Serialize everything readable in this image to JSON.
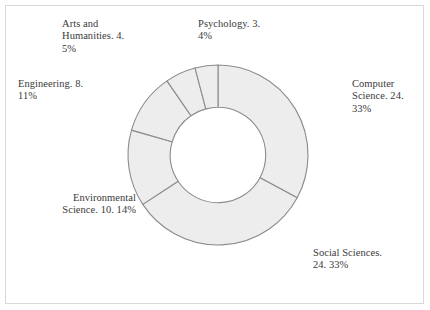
{
  "figure": {
    "background_color": "#ffffff",
    "border_color": "#d8d8d8",
    "slice_fill": "#ededed",
    "slice_stroke": "#8c8c8c",
    "label_color": "#3a3a3a"
  },
  "chart_data": {
    "type": "pie",
    "variant": "donut",
    "title": "",
    "subtitle": "",
    "xlabel": "",
    "ylabel": "",
    "legend_position": "none",
    "grid": false,
    "total": 73,
    "start_angle_deg": 0,
    "direction": "clockwise",
    "inner_radius_ratio": 0.53,
    "categories": [
      "Computer Science",
      "Social Sciences",
      "Environmental Science",
      "Engineering",
      "Arts and Humanities",
      "Psychology"
    ],
    "values": [
      24,
      24,
      10,
      8,
      4,
      3
    ],
    "percents": [
      33,
      33,
      14,
      11,
      5,
      4
    ],
    "slices": [
      {
        "name": "Computer Science",
        "value": 24,
        "percent": 33,
        "label": "Computer\nScience. 24.\n33%",
        "start_deg": 0,
        "end_deg": 118.36
      },
      {
        "name": "Social Sciences",
        "value": 24,
        "percent": 33,
        "label": "Social Sciences.\n24. 33%",
        "start_deg": 118.36,
        "end_deg": 236.71
      },
      {
        "name": "Environmental Science",
        "value": 10,
        "percent": 14,
        "label": "Environmental\nScience. 10. 14%",
        "start_deg": 236.71,
        "end_deg": 286.03
      },
      {
        "name": "Engineering",
        "value": 8,
        "percent": 11,
        "label": "Engineering. 8.\n11%",
        "start_deg": 286.03,
        "end_deg": 325.48
      },
      {
        "name": "Arts and Humanities",
        "value": 4,
        "percent": 5,
        "label": "Arts and\nHumanities. 4.\n5%",
        "start_deg": 325.48,
        "end_deg": 345.21
      },
      {
        "name": "Psychology",
        "value": 3,
        "percent": 4,
        "label": "Psychology. 3.\n4%",
        "start_deg": 345.21,
        "end_deg": 360
      }
    ]
  }
}
